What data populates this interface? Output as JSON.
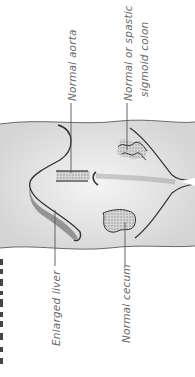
{
  "figure": {
    "orientation": "rotated-90-ccw",
    "labels": [
      {
        "id": "aorta",
        "text": "Normal aorta"
      },
      {
        "id": "sigmoid_line1",
        "text": "Normal or spastic"
      },
      {
        "id": "sigmoid_line2",
        "text": "sigmoid colon"
      },
      {
        "id": "liver",
        "text": "Enlarged liver"
      },
      {
        "id": "cecum",
        "text": "Normal cecum"
      }
    ],
    "title_partial": "",
    "colors": {
      "outline": "#3a3a3a",
      "shading": "#bdbdbd",
      "label_text": "#6a6a6a",
      "leader_line": "#555555",
      "background": "#ffffff"
    }
  }
}
